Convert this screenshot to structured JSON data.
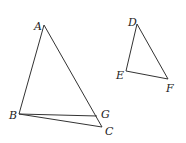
{
  "diagram": {
    "title": "",
    "points": {
      "A": {
        "label": "A",
        "x": 44,
        "y": 25,
        "lx": 34,
        "ly": 30
      },
      "B": {
        "label": "B",
        "x": 19,
        "y": 114,
        "lx": 9,
        "ly": 119
      },
      "C": {
        "label": "C",
        "x": 102,
        "y": 127,
        "lx": 105,
        "ly": 135
      },
      "G": {
        "label": "G",
        "x": 97,
        "y": 116,
        "lx": 101,
        "ly": 118
      },
      "D": {
        "label": "D",
        "x": 137,
        "y": 24,
        "lx": 128,
        "ly": 26
      },
      "E": {
        "label": "E",
        "x": 126,
        "y": 71,
        "lx": 116,
        "ly": 79
      },
      "F": {
        "label": "F",
        "x": 168,
        "y": 79,
        "lx": 166,
        "ly": 92
      }
    },
    "segments": [
      [
        "A",
        "B"
      ],
      [
        "A",
        "C"
      ],
      [
        "B",
        "C"
      ],
      [
        "B",
        "G"
      ],
      [
        "D",
        "E"
      ],
      [
        "E",
        "F"
      ],
      [
        "D",
        "F"
      ]
    ]
  }
}
